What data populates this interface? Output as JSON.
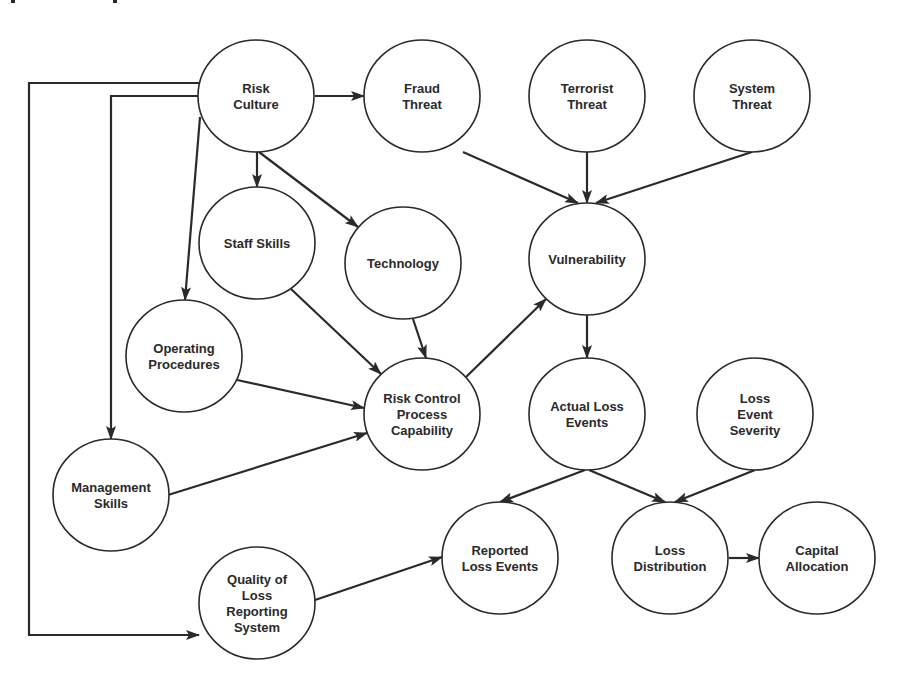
{
  "diagram": {
    "type": "directed-graph",
    "colors": {
      "stroke": "#2a2a2a",
      "node_fill": "#ffffff",
      "background": "#ffffff"
    },
    "nodes": [
      {
        "id": "risk_culture",
        "lines": [
          "Risk",
          "Culture"
        ],
        "cx": 256,
        "cy": 96,
        "rx": 58,
        "ry": 56
      },
      {
        "id": "fraud_threat",
        "lines": [
          "Fraud",
          "Threat"
        ],
        "cx": 422,
        "cy": 96,
        "rx": 58,
        "ry": 56
      },
      {
        "id": "terrorist_threat",
        "lines": [
          "Terrorist",
          "Threat"
        ],
        "cx": 587,
        "cy": 96,
        "rx": 58,
        "ry": 56
      },
      {
        "id": "system_threat",
        "lines": [
          "System",
          "Threat"
        ],
        "cx": 752,
        "cy": 96,
        "rx": 58,
        "ry": 56
      },
      {
        "id": "staff_skills",
        "lines": [
          "Staff Skills"
        ],
        "cx": 257,
        "cy": 243,
        "rx": 58,
        "ry": 56
      },
      {
        "id": "technology",
        "lines": [
          "Technology"
        ],
        "cx": 403,
        "cy": 263,
        "rx": 58,
        "ry": 56
      },
      {
        "id": "vulnerability",
        "lines": [
          "Vulnerability"
        ],
        "cx": 587,
        "cy": 259,
        "rx": 58,
        "ry": 56
      },
      {
        "id": "operating_procedures",
        "lines": [
          "Operating",
          "Procedures"
        ],
        "cx": 184,
        "cy": 356,
        "rx": 58,
        "ry": 56
      },
      {
        "id": "risk_control",
        "lines": [
          "Risk Control",
          "Process",
          "Capability"
        ],
        "cx": 422,
        "cy": 414,
        "rx": 58,
        "ry": 56
      },
      {
        "id": "actual_loss_events",
        "lines": [
          "Actual Loss",
          "Events"
        ],
        "cx": 587,
        "cy": 414,
        "rx": 58,
        "ry": 56
      },
      {
        "id": "loss_event_severity",
        "lines": [
          "Loss",
          "Event",
          "Severity"
        ],
        "cx": 755,
        "cy": 414,
        "rx": 58,
        "ry": 56
      },
      {
        "id": "management_skills",
        "lines": [
          "Management",
          "Skills"
        ],
        "cx": 111,
        "cy": 495,
        "rx": 58,
        "ry": 56
      },
      {
        "id": "reported_loss_events",
        "lines": [
          "Reported",
          "Loss Events"
        ],
        "cx": 500,
        "cy": 558,
        "rx": 58,
        "ry": 56
      },
      {
        "id": "loss_distribution",
        "lines": [
          "Loss",
          "Distribution"
        ],
        "cx": 670,
        "cy": 558,
        "rx": 58,
        "ry": 56
      },
      {
        "id": "capital_allocation",
        "lines": [
          "Capital",
          "Allocation"
        ],
        "cx": 817,
        "cy": 558,
        "rx": 58,
        "ry": 56
      },
      {
        "id": "quality_loss_reporting",
        "lines": [
          "Quality of",
          "Loss",
          "Reporting",
          "System"
        ],
        "cx": 257,
        "cy": 603,
        "rx": 58,
        "ry": 56
      }
    ],
    "edges": [
      {
        "from": "risk_culture",
        "to": "fraud_threat",
        "points": [
          [
            315,
            96
          ],
          [
            364,
            96
          ]
        ]
      },
      {
        "from": "risk_culture",
        "to": "staff_skills",
        "points": [
          [
            257,
            152
          ],
          [
            257,
            187
          ]
        ]
      },
      {
        "from": "risk_culture",
        "to": "technology",
        "points": [
          [
            259,
            152
          ],
          [
            358,
            227
          ]
        ]
      },
      {
        "from": "risk_culture",
        "to": "operating_procedures",
        "points": [
          [
            200,
            117
          ],
          [
            185,
            300
          ]
        ]
      },
      {
        "from": "risk_culture",
        "to": "management_skills",
        "points": [
          [
            198,
            96
          ],
          [
            111,
            96
          ],
          [
            111,
            439
          ]
        ]
      },
      {
        "from": "risk_culture",
        "to": "quality_loss_reporting",
        "points": [
          [
            200,
            83
          ],
          [
            29,
            83
          ],
          [
            29,
            635
          ],
          [
            199,
            635
          ]
        ]
      },
      {
        "from": "fraud_threat",
        "to": "vulnerability",
        "points": [
          [
            463,
            152
          ],
          [
            578,
            203
          ]
        ]
      },
      {
        "from": "terrorist_threat",
        "to": "vulnerability",
        "points": [
          [
            587,
            152
          ],
          [
            587,
            203
          ]
        ]
      },
      {
        "from": "system_threat",
        "to": "vulnerability",
        "points": [
          [
            752,
            152
          ],
          [
            596,
            203
          ]
        ]
      },
      {
        "from": "staff_skills",
        "to": "risk_control",
        "points": [
          [
            291,
            289
          ],
          [
            381,
            374
          ]
        ]
      },
      {
        "from": "technology",
        "to": "risk_control",
        "points": [
          [
            413,
            319
          ],
          [
            426,
            358
          ]
        ]
      },
      {
        "from": "operating_procedures",
        "to": "risk_control",
        "points": [
          [
            237,
            380
          ],
          [
            364,
            408
          ]
        ]
      },
      {
        "from": "management_skills",
        "to": "risk_control",
        "points": [
          [
            168,
            495
          ],
          [
            367,
            433
          ]
        ]
      },
      {
        "from": "risk_control",
        "to": "vulnerability",
        "points": [
          [
            466,
            377
          ],
          [
            546,
            299
          ]
        ]
      },
      {
        "from": "vulnerability",
        "to": "actual_loss_events",
        "points": [
          [
            587,
            315
          ],
          [
            587,
            358
          ]
        ]
      },
      {
        "from": "actual_loss_events",
        "to": "reported_loss_events",
        "points": [
          [
            585,
            470
          ],
          [
            500,
            502
          ]
        ]
      },
      {
        "from": "actual_loss_events",
        "to": "loss_distribution",
        "points": [
          [
            589,
            470
          ],
          [
            665,
            502
          ]
        ]
      },
      {
        "from": "loss_event_severity",
        "to": "loss_distribution",
        "points": [
          [
            755,
            470
          ],
          [
            675,
            502
          ]
        ]
      },
      {
        "from": "quality_loss_reporting",
        "to": "reported_loss_events",
        "points": [
          [
            315,
            600
          ],
          [
            442,
            557
          ]
        ]
      },
      {
        "from": "loss_distribution",
        "to": "capital_allocation",
        "points": [
          [
            729,
            558
          ],
          [
            759,
            558
          ]
        ]
      }
    ]
  }
}
